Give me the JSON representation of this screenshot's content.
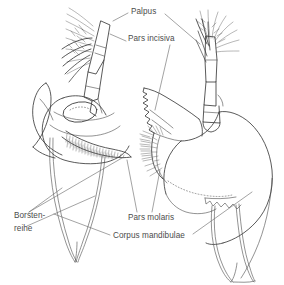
{
  "figure": {
    "kind": "scientific-line-drawing",
    "background_color": "#ffffff",
    "ink_color": "#3c3c3c",
    "label_color": "#4c4c4c",
    "leader_color": "#6a6a6a",
    "labels": [
      {
        "id": "palpus",
        "text": "Palpus",
        "x": 131,
        "y": 14
      },
      {
        "id": "pars-incisiva",
        "text": "Pars incisiva",
        "x": 128,
        "y": 41
      },
      {
        "id": "borsten-line1",
        "text": "Borsten-",
        "x": 14,
        "y": 218
      },
      {
        "id": "borsten-line2",
        "text": "reihe",
        "x": 14,
        "y": 231
      },
      {
        "id": "pars-molaris",
        "text": "Pars molaris",
        "x": 128,
        "y": 220
      },
      {
        "id": "corpus-mandibulae",
        "text": "Corpus mandibulae",
        "x": 113,
        "y": 238
      }
    ],
    "specimens": [
      {
        "id": "left-mandible",
        "position": "left",
        "description": "left mandible with palpus, molar process and seta row"
      },
      {
        "id": "right-mandible",
        "position": "right",
        "description": "right mandible with incisor process, molar process and palpus"
      }
    ]
  }
}
